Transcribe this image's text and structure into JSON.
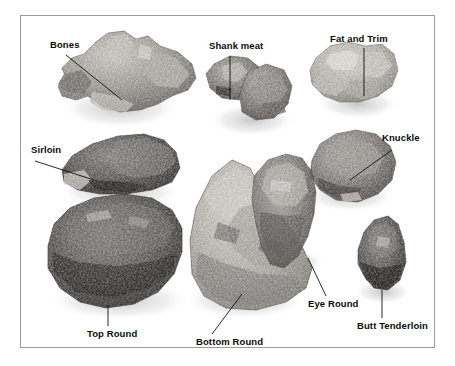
{
  "figure": {
    "background_color": "#ffffff",
    "frame_color": "#9a9a9a",
    "text_color": "#0b0b0b"
  },
  "labels": [
    {
      "id": "bones",
      "text": "Bones"
    },
    {
      "id": "shank_meat",
      "text": "Shank meat"
    },
    {
      "id": "fat_and_trim",
      "text": "Fat and Trim"
    },
    {
      "id": "knuckle",
      "text": "Knuckle"
    },
    {
      "id": "sirloin",
      "text": "Sirloin"
    },
    {
      "id": "top_round",
      "text": "Top Round"
    },
    {
      "id": "bottom_round",
      "text": "Bottom Round"
    },
    {
      "id": "eye_round",
      "text": "Eye Round"
    },
    {
      "id": "butt_tenderloin",
      "text": "Butt Tenderloin"
    }
  ]
}
